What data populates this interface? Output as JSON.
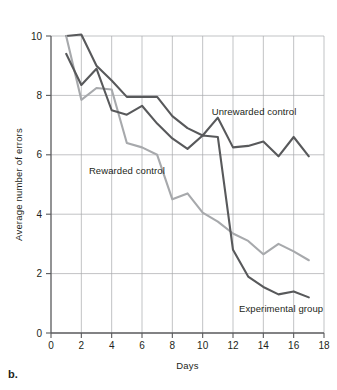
{
  "figure": {
    "panel_caption": "b.",
    "background_color": "#ffffff"
  },
  "chart_data": {
    "type": "line",
    "title": "",
    "xlabel": "Days",
    "ylabel": "Average number of errors",
    "xlim": [
      0,
      18
    ],
    "ylim": [
      0,
      10
    ],
    "xticks": [
      0,
      2,
      4,
      6,
      8,
      10,
      12,
      14,
      16,
      18
    ],
    "xtick_labels": [
      "0",
      "2",
      "4",
      "6",
      "8",
      "10",
      "12",
      "14",
      "16",
      "18"
    ],
    "yticks": [
      0,
      2,
      4,
      6,
      8,
      10
    ],
    "ytick_labels": [
      "0",
      "2",
      "4",
      "6",
      "8",
      "10"
    ],
    "grid": true,
    "grid_color": "#a7a9ac",
    "legend_position": "inline-annotations",
    "x": [
      1,
      2,
      3,
      4,
      5,
      6,
      7,
      8,
      9,
      10,
      11,
      12,
      13,
      14,
      15,
      16,
      17
    ],
    "series": [
      {
        "name": "Unrewarded control",
        "color": "#58595b",
        "label_x": 10.6,
        "label_y": 7.35,
        "values": [
          10.0,
          10.05,
          9.0,
          8.5,
          7.95,
          7.95,
          7.95,
          7.3,
          6.9,
          6.65,
          7.25,
          6.25,
          6.3,
          6.45,
          5.95,
          6.6,
          5.95
        ]
      },
      {
        "name": "Rewarded control",
        "color": "#a7a9ac",
        "label_x": 2.5,
        "label_y": 5.35,
        "values": [
          10.0,
          7.85,
          8.25,
          8.2,
          6.4,
          6.25,
          6.0,
          4.5,
          4.7,
          4.05,
          3.75,
          3.35,
          3.1,
          2.65,
          3.0,
          2.75,
          2.45
        ]
      },
      {
        "name": "Experimental group",
        "color": "#58595b",
        "label_x": 12.4,
        "label_y": 0.7,
        "values": [
          9.4,
          8.35,
          8.9,
          7.5,
          7.35,
          7.65,
          7.05,
          6.55,
          6.2,
          6.65,
          6.6,
          2.8,
          1.9,
          1.55,
          1.3,
          1.4,
          1.2
        ]
      }
    ]
  }
}
